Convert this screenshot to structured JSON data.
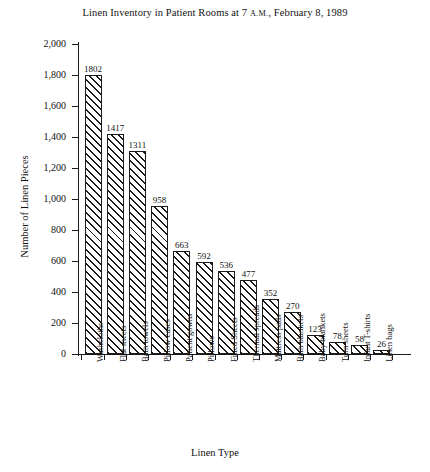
{
  "chart_data": {
    "type": "bar",
    "title": "Linen Inventory in Patient Rooms at 7 A.M., February 8, 1989",
    "title_parts": {
      "before": "Linen Inventory in Patient Rooms at 7 ",
      "smallcaps": "A.M.",
      "after": ", February 8, 1989"
    },
    "xlabel": "Linen Type",
    "ylabel": "Number of Linen Pieces",
    "ylim": [
      0,
      2000
    ],
    "ytick_step": 200,
    "ytick_labels": [
      "0",
      "200",
      "400",
      "600",
      "800",
      "1,000",
      "1,200",
      "1,400",
      "1,600",
      "1,800",
      "2,000"
    ],
    "ytick_values": [
      0,
      200,
      400,
      600,
      800,
      1000,
      1200,
      1400,
      1600,
      1800,
      2000
    ],
    "grid": false,
    "legend": "none",
    "bar_fill": "diagonal-hatch",
    "bar_edge_color": "#1b1b1b",
    "categories": [
      "Washcloths",
      "Flat sheets",
      "Bath towels",
      "Pillow cases",
      "Patient gowns",
      "Pillows",
      "Fitted Sheets",
      "Thermal spreads",
      "Mattress pads",
      "Bath blankets",
      "Baby blankets",
      "Turn sheets",
      "Infant T-shirts",
      "Linen bags"
    ],
    "values": [
      1802,
      1417,
      1311,
      958,
      663,
      592,
      536,
      477,
      352,
      270,
      123,
      78,
      58,
      26
    ],
    "value_labels": [
      "1802",
      "1417",
      "1311",
      "958",
      "663",
      "592",
      "536",
      "477",
      "352",
      "270",
      "123",
      "78",
      "58",
      "26"
    ]
  }
}
